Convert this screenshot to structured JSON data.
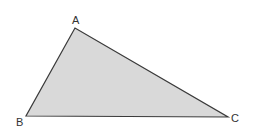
{
  "diagram": {
    "type": "triangle",
    "fill_color": "#d9d9d9",
    "stroke_color": "#3a3a3a",
    "vertices": [
      {
        "label": "A",
        "x": 75,
        "y": 28,
        "label_x": 72,
        "label_y": 24
      },
      {
        "label": "B",
        "x": 26,
        "y": 116,
        "label_x": 16,
        "label_y": 126
      },
      {
        "label": "C",
        "x": 228,
        "y": 117,
        "label_x": 231,
        "label_y": 122
      }
    ]
  }
}
